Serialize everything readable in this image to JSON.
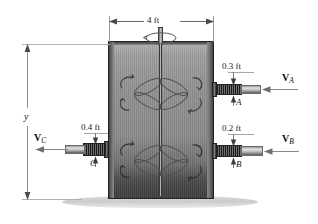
{
  "figure": {
    "top_dimension": "4 ft",
    "height_dimension": "y",
    "ports": [
      {
        "id": "A",
        "label": "A",
        "dimension": "0.3 ft",
        "vector_symbol": "V",
        "vector_subscript": "A",
        "flow": "inlet",
        "side": "right"
      },
      {
        "id": "B",
        "label": "B",
        "dimension": "0.2 ft",
        "vector_symbol": "V",
        "vector_subscript": "B",
        "flow": "inlet",
        "side": "right"
      },
      {
        "id": "C",
        "label": "C",
        "dimension": "0.4 ft",
        "vector_symbol": "V",
        "vector_subscript": "C",
        "flow": "outlet",
        "side": "left"
      }
    ],
    "impellers": [
      {
        "id": "upper-impeller",
        "blades": 4
      },
      {
        "id": "lower-impeller",
        "blades": 4
      }
    ],
    "shaft": {
      "rotation_indicator": "circular-arrow"
    },
    "colors": {
      "tank_body": "#8a8a8a",
      "tank_outline": "#2b2b2b",
      "tank_shadow": "#3a3a3a",
      "pipe_dark": "#1c1c1c",
      "pipe_light": "#e2e2e2",
      "ground": "#d8d8d8",
      "dimension_line": "#6b6b6b",
      "text": "#1a1a1a"
    }
  }
}
